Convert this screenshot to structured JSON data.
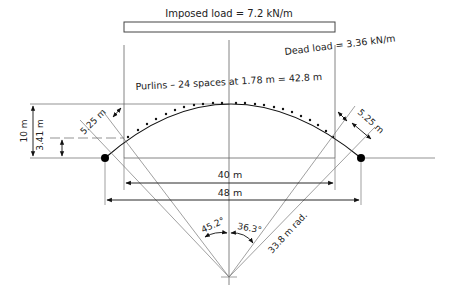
{
  "diagram": {
    "imposed_load": "Imposed load = 7.2 kN/m",
    "dead_load": "Dead load = 3.36 kN/m",
    "purlins": "Purlins – 24 spaces at 1.78 m = 42.8 m",
    "height_total": "10 m",
    "height_support": "3.41 m",
    "offset_left": "5.25 m",
    "offset_right": "5.25 m",
    "span_inner": "40 m",
    "span_outer": "48 m",
    "angle_left": "45.2°",
    "angle_right": "36.3°",
    "radius": "33.8 m rad."
  },
  "colors": {
    "line": "#555555",
    "ink": "#111111",
    "box": "#444444"
  }
}
